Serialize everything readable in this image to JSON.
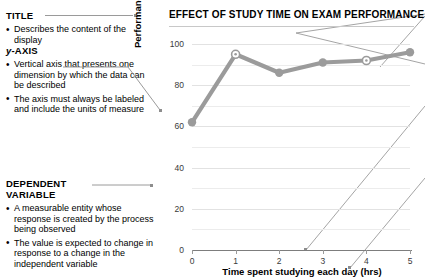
{
  "annotations": [
    {
      "id": "title",
      "heading": "TITLE",
      "heading_italic_prefix": "",
      "bullets": [
        "Describes the content of the display"
      ]
    },
    {
      "id": "y-axis",
      "heading": "-AXIS",
      "heading_italic_prefix": "y",
      "bullets": [
        "Vertical axis that presents one dimension by which the data can be described",
        "The axis must always be labeled and include the units of measure"
      ]
    },
    {
      "id": "dependent-variable",
      "heading": "DEPENDENT VARIABLE",
      "heading_italic_prefix": "",
      "bullets": [
        "A measurable entity whose response is created by the process being observed",
        "The value is expected to change in response to a change in the independent variable"
      ]
    }
  ],
  "chart_data": {
    "type": "line",
    "title": "EFFECT OF STUDY TIME ON EXAM PERFORMANCE",
    "xlabel": "Time spent studying each day (hrs)",
    "ylabel": "Performance on midterm exams (%)",
    "x": [
      0,
      1,
      2,
      3,
      4,
      5
    ],
    "values": [
      62,
      95,
      86,
      91,
      92,
      96
    ],
    "xticks": [
      "0",
      "1",
      "2",
      "3",
      "4",
      "5"
    ],
    "yticks": [
      "0",
      "20",
      "40",
      "60",
      "80",
      "100"
    ],
    "xlim": [
      0,
      5
    ],
    "ylim": [
      0,
      100
    ],
    "grid": true,
    "legend": "none",
    "series_color": "#9b9b9b",
    "marker_highlight_indices": [
      1,
      4
    ]
  }
}
